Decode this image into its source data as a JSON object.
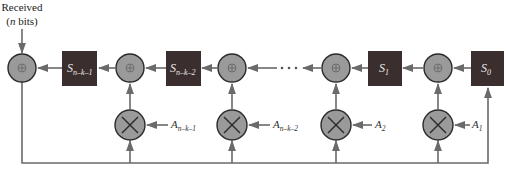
{
  "input_label": {
    "line1": "Received",
    "line2_italic": "n",
    "line2_rest": " bits)",
    "line2_open": "("
  },
  "registers": [
    {
      "id": "s_n_k_1",
      "base": "S",
      "sub": "n–k–1"
    },
    {
      "id": "s_n_k_2",
      "base": "S",
      "sub": "n–k–2"
    },
    {
      "id": "s_1",
      "base": "S",
      "sub": "1"
    },
    {
      "id": "s_0",
      "base": "S",
      "sub": "0"
    }
  ],
  "coefficients": [
    {
      "id": "a_n_k_1",
      "base": "A",
      "sub": "n–k–1"
    },
    {
      "id": "a_n_k_2",
      "base": "A",
      "sub": "n–k–2"
    },
    {
      "id": "a_2",
      "base": "A",
      "sub": "2"
    },
    {
      "id": "a_1",
      "base": "A",
      "sub": "1"
    }
  ],
  "ellipsis": "· · ·",
  "xor_symbol": "⊕",
  "multiply_symbol": "×"
}
